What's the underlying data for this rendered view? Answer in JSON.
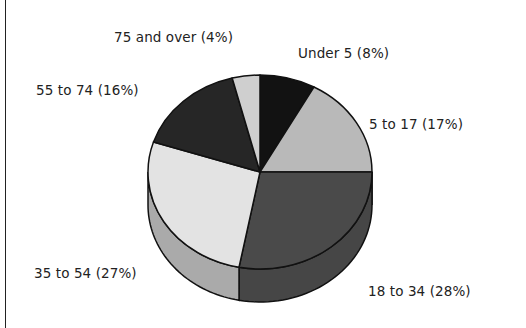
{
  "chart_data": {
    "type": "pie",
    "style": "3d",
    "title": "",
    "start_angle_deg": 0,
    "direction": "clockwise",
    "slices": [
      {
        "label": "Under 5",
        "value": 8,
        "display": "Under 5  (8%)",
        "color": "#121212"
      },
      {
        "label": "5 to 17",
        "value": 17,
        "display": "5 to 17 (17%)",
        "color": "#b9b9b9"
      },
      {
        "label": "18 to 34",
        "value": 28,
        "display": "18 to 34 (28%)",
        "color": "#4a4a4a"
      },
      {
        "label": "35 to 54",
        "value": 27,
        "display": "35 to 54 (27%)",
        "color": "#e3e3e3"
      },
      {
        "label": "55 to 74",
        "value": 16,
        "display": "55 to 74 (16%)",
        "color": "#262626"
      },
      {
        "label": "75 and over",
        "value": 4,
        "display": "75 and over (4%)",
        "color": "#cfcfcf"
      }
    ],
    "legend": "none (labels beside slices)"
  },
  "labels": {
    "under5": "Under 5  (8%)",
    "age5to17": "5 to 17 (17%)",
    "age18to34": "18 to 34 (28%)",
    "age35to54": "35 to 54 (27%)",
    "age55to74": "55 to 74 (16%)",
    "age75plus": "75 and over (4%)"
  }
}
